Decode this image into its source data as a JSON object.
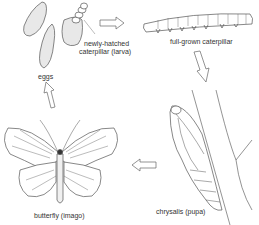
{
  "diagram": {
    "stages": [
      {
        "id": "eggs",
        "label": "eggs"
      },
      {
        "id": "larva",
        "label_line1": "newly-hatched",
        "label_line2": "caterpillar (larva)"
      },
      {
        "id": "caterpillar",
        "label": "full-grown caterpillar"
      },
      {
        "id": "pupa",
        "label": "chrysalis (pupa)"
      },
      {
        "id": "imago",
        "label": "butterfly (imago)"
      }
    ],
    "arrows": [
      {
        "from": "larva",
        "to": "caterpillar",
        "direction": "right"
      },
      {
        "from": "caterpillar",
        "to": "pupa",
        "direction": "down"
      },
      {
        "from": "pupa",
        "to": "imago",
        "direction": "left"
      },
      {
        "from": "imago",
        "to": "eggs",
        "direction": "up"
      }
    ],
    "colors": {
      "line": "#555555",
      "fill": "#ffffff",
      "text": "#333333"
    }
  }
}
